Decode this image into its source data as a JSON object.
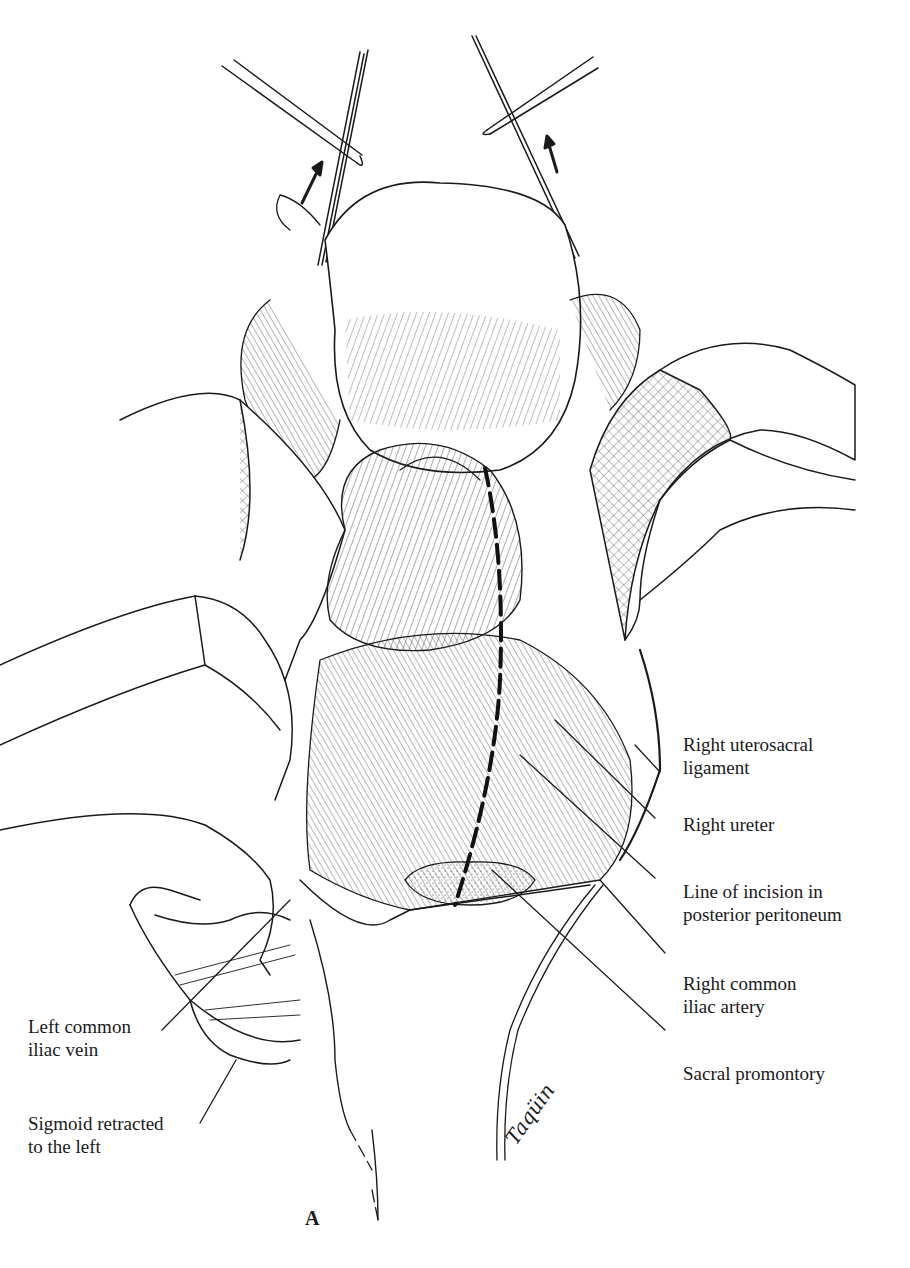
{
  "figure": {
    "panel_label": "A",
    "signature": "Taqüin",
    "labels_right": [
      {
        "id": "right-uterosacral-ligament",
        "lines": [
          "Right uterosacral",
          "ligament"
        ]
      },
      {
        "id": "right-ureter",
        "lines": [
          "Right ureter"
        ]
      },
      {
        "id": "line-of-incision",
        "lines": [
          "Line of incision in",
          "posterior peritoneum"
        ]
      },
      {
        "id": "right-common-iliac-artery",
        "lines": [
          "Right common",
          "iliac artery"
        ]
      },
      {
        "id": "sacral-promontory",
        "lines": [
          "Sacral promontory"
        ]
      }
    ],
    "labels_left": [
      {
        "id": "left-common-iliac-vein",
        "lines": [
          "Left common",
          "iliac vein"
        ]
      },
      {
        "id": "sigmoid-retracted",
        "lines": [
          "Sigmoid retracted",
          "to the left"
        ]
      }
    ],
    "annotations": {
      "arrows": [
        "traction-arrow-left",
        "traction-arrow-right"
      ],
      "incision_line_style": "dashed"
    }
  }
}
